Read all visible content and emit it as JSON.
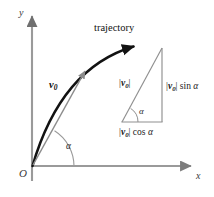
{
  "figure": {
    "type": "projectile-trajectory-diagram",
    "background_color": "#ffffff",
    "axes": {
      "x_label": "x",
      "y_label": "y",
      "origin_label": "O",
      "color": "#8f8f8f",
      "x_axis": {
        "x1": 32,
        "y1": 166,
        "x2": 196,
        "y2": 166
      },
      "y_axis": {
        "x1": 32,
        "y1": 180,
        "x2": 32,
        "y2": 11
      }
    },
    "trajectory": {
      "label": "trajectory",
      "color": "#121212",
      "start": {
        "x": 32,
        "y": 166
      },
      "end": {
        "x": 140,
        "y": 42
      },
      "control": {
        "x": 62,
        "y": 70
      }
    },
    "velocity_vector": {
      "label_base": "v",
      "label_subscript": "0",
      "color": "#8c8c8c",
      "start": {
        "x": 33,
        "y": 165
      },
      "end": {
        "x": 88,
        "y": 67
      }
    },
    "launch_angle": {
      "label": "α",
      "arc_radius": 42,
      "color": "#8f8f8f"
    },
    "inset_triangle": {
      "color": "#8f8f8f",
      "apex": {
        "x": 162,
        "y": 48
      },
      "right_angle": {
        "x": 162,
        "y": 122
      },
      "left_vertex": {
        "x": 122,
        "y": 122
      },
      "angle_label": "α",
      "hypotenuse_label": {
        "magnitude_open": "|",
        "base": "v",
        "subscript": "0",
        "magnitude_close": "|"
      },
      "vertical_leg_label": {
        "magnitude_open": "|",
        "base": "v",
        "subscript": "0",
        "magnitude_close": "|",
        "function": "sin",
        "angle": "α"
      },
      "horizontal_leg_label": {
        "magnitude_open": "|",
        "base": "v",
        "subscript": "0",
        "magnitude_close": "|",
        "function": "cos",
        "angle": "α"
      }
    }
  }
}
